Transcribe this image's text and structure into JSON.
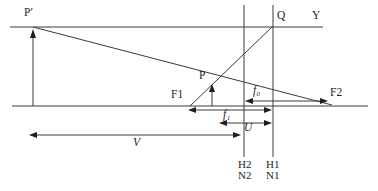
{
  "diagram": {
    "type": "optical-lens-principal-planes-diagram",
    "labels": {
      "image_point": "P′",
      "q_point": "Q",
      "y_axis_ray": "Y",
      "object_point": "P",
      "front_focal_point": "F1",
      "rear_focal_point": "F2",
      "rear_focal_length": "f₀",
      "front_focal_length": "f₁",
      "object_distance": "U",
      "image_distance": "V",
      "principal_plane_2": "H2",
      "nodal_point_2": "N2",
      "principal_plane_1": "H1",
      "nodal_point_1": "N1"
    },
    "colors": {
      "line": "#3a3a3a",
      "text": "#1f1f1f",
      "background": "#ffffff"
    }
  }
}
